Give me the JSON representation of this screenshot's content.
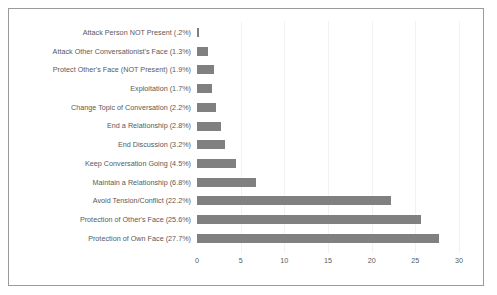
{
  "chart_data": {
    "type": "bar",
    "orientation": "horizontal",
    "title": "",
    "xlabel": "",
    "ylabel": "",
    "xlim": [
      0,
      30
    ],
    "xticks": [
      0,
      5,
      10,
      15,
      20,
      25,
      30
    ],
    "xtick_labels": [
      "0",
      "5",
      "10",
      "15",
      "20",
      "25",
      "30"
    ],
    "grid": "vertical-faint",
    "legend": "none",
    "bar_color": "#808080",
    "frame_color": "#9a9a9a",
    "text_color": "#595959",
    "background_color": "#ffffff",
    "categories": [
      "Attack Person NOT Present (.2%)",
      "Attack Other Conversationist's Face (1.3%)",
      "Protect Other's Face (NOT Present) (1.9%)",
      "Exploitation (1.7%)",
      "Change Topic of Conversation (2.2%)",
      "End a Relationship (2.8%)",
      "End Discussion (3.2%)",
      "Keep Conversation Going (4.5%)",
      "Maintain a Relationship (6.8%)",
      "Avoid Tension/Conflict (22.2%)",
      "Protection of Other's Face (25.6%)",
      "Protection of Own Face (27.7%)"
    ],
    "values": [
      0.2,
      1.3,
      1.9,
      1.7,
      2.2,
      2.8,
      3.2,
      4.5,
      6.8,
      22.2,
      25.6,
      27.7
    ]
  }
}
